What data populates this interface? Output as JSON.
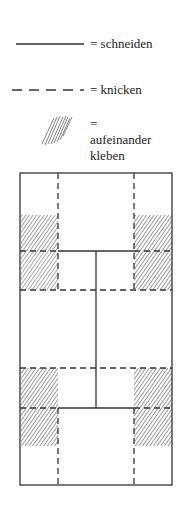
{
  "legend": {
    "items": [
      {
        "symbol": "solid-line",
        "label": "= schneiden"
      },
      {
        "symbol": "dashed-line",
        "label": "= knicken"
      },
      {
        "symbol": "hatch",
        "label": "= aufeinander kleben"
      }
    ]
  },
  "diagram": {
    "colors": {
      "line": "#333333",
      "hatch": "#444444",
      "background": "#ffffff"
    }
  }
}
